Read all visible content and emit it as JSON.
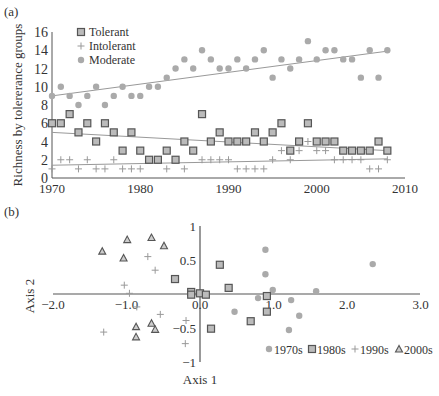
{
  "chart_data": [
    {
      "panel_label": "(a)",
      "type": "scatter",
      "title": "",
      "xlabel": "",
      "ylabel": "Richness by tolererance groups",
      "xlim": [
        1970,
        2010
      ],
      "ylim": [
        0,
        16
      ],
      "xticks": [
        "1970",
        "1980",
        "1990",
        "2000",
        "2010"
      ],
      "yticks": [
        "0",
        "2",
        "4",
        "6",
        "8",
        "10",
        "12",
        "14",
        "16"
      ],
      "grid": false,
      "legend_position": "upper left",
      "legend": [
        "Tolerant",
        "Intolerant",
        "Moderate"
      ],
      "x": [
        1970,
        1971,
        1972,
        1973,
        1974,
        1975,
        1976,
        1977,
        1978,
        1979,
        1980,
        1981,
        1982,
        1983,
        1984,
        1985,
        1986,
        1987,
        1988,
        1989,
        1990,
        1991,
        1992,
        1993,
        1994,
        1995,
        1996,
        1997,
        1998,
        1999,
        2000,
        2001,
        2002,
        2003,
        2004,
        2005,
        2006,
        2007,
        2008
      ],
      "series": [
        {
          "name": "Tolerant",
          "marker": "square",
          "color": "#777777",
          "values": [
            6,
            6,
            7,
            5,
            6,
            4,
            6,
            5,
            3,
            5,
            3,
            2,
            2,
            3,
            2,
            4,
            3,
            7,
            4,
            5,
            4,
            4,
            4,
            5,
            4,
            5,
            6,
            3,
            4,
            6,
            4,
            4,
            4,
            3,
            3,
            3,
            3,
            4,
            3
          ],
          "trend": [
            5.0,
            3.0
          ]
        },
        {
          "name": "Intolerant",
          "marker": "plus",
          "color": "#999999",
          "values": [
            1,
            2,
            2,
            1,
            2,
            1,
            1,
            2,
            1,
            1,
            1,
            null,
            null,
            1,
            null,
            1,
            null,
            2,
            2,
            2,
            2,
            1,
            1,
            1,
            1,
            2,
            3,
            2,
            3,
            4,
            3,
            3,
            2,
            2,
            2,
            2,
            1,
            1,
            2
          ],
          "trend": [
            1.4,
            2.1
          ]
        },
        {
          "name": "Moderate",
          "marker": "circle",
          "color": "#aaaaaa",
          "values": [
            9,
            10,
            9,
            8,
            9,
            10,
            8,
            9,
            10,
            9,
            9,
            10,
            10,
            11,
            12,
            13,
            12,
            14,
            13,
            12,
            12,
            13,
            12,
            13,
            14,
            11,
            13,
            12,
            13,
            15,
            13,
            14,
            14,
            13,
            13,
            11,
            14,
            11,
            14
          ],
          "trend": [
            9.0,
            13.9
          ]
        }
      ]
    },
    {
      "panel_label": "(b)",
      "type": "scatter",
      "title": "",
      "xlabel": "Axis 1",
      "ylabel": "Axis 2",
      "xlim": [
        -2.0,
        3.0
      ],
      "ylim": [
        -1,
        1
      ],
      "xticks": [
        "-2.0",
        "-1.0",
        "0.0",
        "1.0",
        "2.0",
        "3.0"
      ],
      "yticks": [
        "-1",
        "-0.5",
        "0.5",
        "1"
      ],
      "grid": false,
      "legend_position": "lower right",
      "legend": [
        "1970s",
        "1980s",
        "1990s",
        "2000s"
      ],
      "series": [
        {
          "name": "1970s",
          "marker": "circle",
          "color": "#aaaaaa",
          "points": [
            [
              0.89,
              0.65
            ],
            [
              0.89,
              0.29
            ],
            [
              0.99,
              0.06
            ],
            [
              0.79,
              -0.06
            ],
            [
              1.24,
              -0.09
            ],
            [
              0.47,
              -0.26
            ],
            [
              1.35,
              -0.32
            ],
            [
              1.21,
              -0.53
            ],
            [
              1.58,
              0.04
            ],
            [
              2.35,
              0.44
            ]
          ]
        },
        {
          "name": "1980s",
          "marker": "square",
          "color": "#777777",
          "points": [
            [
              0.27,
              0.43
            ],
            [
              0.39,
              0.09
            ],
            [
              0.0,
              0.01
            ],
            [
              0.08,
              -0.01
            ],
            [
              0.91,
              -0.03
            ],
            [
              0.91,
              -0.26
            ],
            [
              0.69,
              -0.4
            ],
            [
              0.15,
              -0.51
            ],
            [
              -0.34,
              0.22
            ],
            [
              -0.12,
              0.03
            ],
            [
              -0.12,
              -0.01
            ]
          ]
        },
        {
          "name": "1990s",
          "marker": "plus",
          "color": "#999999",
          "points": [
            [
              -0.71,
              0.55
            ],
            [
              -0.61,
              0.35
            ],
            [
              -1.03,
              0.13
            ],
            [
              -0.96,
              0.01
            ],
            [
              -0.86,
              -0.19
            ],
            [
              -0.54,
              -0.3
            ],
            [
              -0.19,
              -0.39
            ],
            [
              -1.31,
              -0.56
            ],
            [
              -0.2,
              -0.73
            ]
          ]
        },
        {
          "name": "2000s",
          "marker": "triangle",
          "color": "#888888",
          "points": [
            [
              -1.33,
              0.63
            ],
            [
              -0.99,
              0.8
            ],
            [
              -0.66,
              0.83
            ],
            [
              -0.49,
              0.71
            ],
            [
              -1.04,
              0.53
            ],
            [
              -0.87,
              -0.48
            ],
            [
              -0.66,
              -0.43
            ],
            [
              -0.61,
              -0.52
            ],
            [
              -0.87,
              -0.63
            ]
          ]
        }
      ]
    }
  ],
  "panels": {
    "a": {
      "label": "(a)"
    },
    "b": {
      "label": "(b)"
    }
  }
}
